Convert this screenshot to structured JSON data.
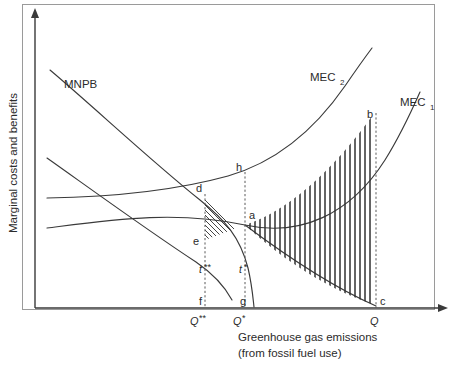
{
  "figure": {
    "type": "economics-diagram",
    "title": "",
    "background_color": "#ffffff",
    "line_color": "#3a3a3a",
    "text_color": "#2b2b2b"
  },
  "axes": {
    "y_label": "Marginal costs and benefits",
    "x_label_line1": "Greenhouse gas emissions",
    "x_label_line2": "(from fossil fuel use)",
    "x_arrow": true,
    "y_arrow": true
  },
  "curves": [
    {
      "id": "mnpb",
      "label": "MNPB",
      "subscript": "",
      "shape": "downward-sloping-convex"
    },
    {
      "id": "mec1",
      "label": "MEC",
      "subscript": "1",
      "shape": "upward-sloping-convex"
    },
    {
      "id": "mec2",
      "label": "MEC",
      "subscript": "2",
      "shape": "upward-sloping-convex-higher"
    },
    {
      "id": "mnpb-lower",
      "label": "",
      "subscript": "",
      "shape": "downward-sloping-flat"
    }
  ],
  "points": [
    {
      "id": "a",
      "label": "a"
    },
    {
      "id": "b",
      "label": "b"
    },
    {
      "id": "c",
      "label": "c"
    },
    {
      "id": "d",
      "label": "d"
    },
    {
      "id": "e",
      "label": "e"
    },
    {
      "id": "f",
      "label": "f"
    },
    {
      "id": "g",
      "label": "g"
    },
    {
      "id": "h",
      "label": "h"
    }
  ],
  "tax_labels": [
    {
      "id": "t-double-star",
      "base": "t",
      "sup": "**"
    },
    {
      "id": "t-star",
      "base": "t",
      "sup": "*"
    }
  ],
  "x_ticks": [
    {
      "id": "q-double-star",
      "base": "Q",
      "sup": "**"
    },
    {
      "id": "q-star",
      "base": "Q",
      "sup": "*"
    },
    {
      "id": "q",
      "base": "Q",
      "sup": ""
    }
  ],
  "shaded_regions": [
    {
      "id": "region-abc",
      "vertices": [
        "a",
        "b",
        "c"
      ],
      "hatch": "vertical"
    },
    {
      "id": "region-dea",
      "vertices": [
        "d",
        "e",
        "a"
      ],
      "hatch": "diagonal"
    }
  ]
}
